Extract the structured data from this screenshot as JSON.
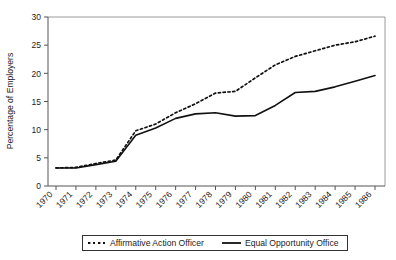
{
  "chart_data": {
    "type": "line",
    "title": "",
    "xlabel": "",
    "ylabel": "Percentage of Employers",
    "ylim": [
      0,
      30
    ],
    "yticks": [
      0,
      5,
      10,
      15,
      20,
      25,
      30
    ],
    "grid": false,
    "legend_position": "bottom",
    "categories": [
      "1970",
      "1971",
      "1972",
      "1973",
      "1974",
      "1975",
      "1976",
      "1977",
      "1978",
      "1979",
      "1980",
      "1981",
      "1982",
      "1983",
      "1984",
      "1985",
      "1986"
    ],
    "x": [
      1970,
      1971,
      1972,
      1973,
      1974,
      1975,
      1976,
      1977,
      1978,
      1979,
      1980,
      1981,
      1982,
      1983,
      1984,
      1985,
      1986
    ],
    "series": [
      {
        "name": "Affirmative Action Officer",
        "style": "dashed",
        "color": "#111111",
        "values": [
          3.2,
          3.3,
          4.0,
          4.6,
          9.8,
          11.0,
          13.0,
          14.6,
          16.5,
          16.8,
          19.2,
          21.5,
          23.0,
          24.0,
          25.0,
          25.6,
          26.6
        ]
      },
      {
        "name": "Equal Opportunity Office",
        "style": "solid",
        "color": "#111111",
        "values": [
          3.2,
          3.2,
          3.8,
          4.4,
          9.0,
          10.3,
          12.0,
          12.8,
          13.0,
          12.4,
          12.5,
          14.3,
          16.6,
          16.8,
          17.6,
          18.6,
          19.6
        ]
      }
    ]
  },
  "legend": {
    "items": [
      {
        "label": "Affirmative Action Officer",
        "style": "dashed"
      },
      {
        "label": "Equal Opportunity Office",
        "style": "solid"
      }
    ]
  },
  "axis": {
    "y_title": "Percentage of Employers",
    "y_ticks": [
      "0",
      "5",
      "10",
      "15",
      "20",
      "25",
      "30"
    ],
    "x_ticks": [
      "1970",
      "1971",
      "1972",
      "1973",
      "1974",
      "1975",
      "1976",
      "1977",
      "1978",
      "1979",
      "1980",
      "1981",
      "1982",
      "1983",
      "1984",
      "1985",
      "1986"
    ]
  }
}
